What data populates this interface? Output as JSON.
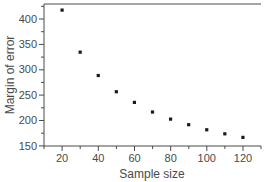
{
  "chart_data": {
    "type": "scatter",
    "title": "",
    "xlabel": "Sample size",
    "ylabel": "Margin of error",
    "x": [
      20,
      30,
      40,
      50,
      60,
      70,
      80,
      90,
      100,
      110,
      120
    ],
    "values": [
      418,
      335,
      289,
      257,
      236,
      217,
      203,
      192,
      182,
      174,
      167
    ],
    "series": [
      {
        "name": "Margin of error",
        "x": [
          20,
          30,
          40,
          50,
          60,
          70,
          80,
          90,
          100,
          110,
          120
        ],
        "values": [
          418,
          335,
          289,
          257,
          236,
          217,
          203,
          192,
          182,
          174,
          167
        ]
      }
    ],
    "xlim": [
      10,
      130
    ],
    "ylim": [
      150,
      430
    ],
    "xticks": [
      20,
      40,
      60,
      80,
      100,
      120
    ],
    "xticks_minor": [
      10,
      30,
      50,
      70,
      90,
      110,
      130
    ],
    "yticks": [
      150,
      200,
      250,
      300,
      350,
      400
    ],
    "xtick_labels": [
      "20",
      "40",
      "60",
      "80",
      "100",
      "120"
    ],
    "ytick_labels": [
      "150",
      "200",
      "250",
      "300",
      "350",
      "400"
    ],
    "grid": false,
    "legend": false,
    "legend_position": "none",
    "marker": "square",
    "marker_color": "#1a1a1a",
    "axis_color": "#4a4a4a",
    "background_color": "#ffffff",
    "annotations": []
  },
  "axes": {
    "x_title": "Sample size",
    "y_title": "Margin of error"
  }
}
